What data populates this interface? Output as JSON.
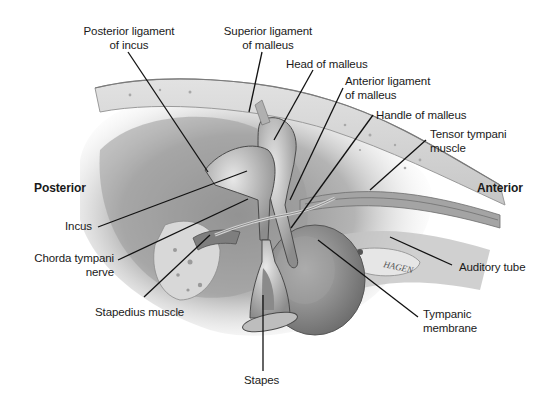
{
  "figure": {
    "orientation": {
      "left": "Posterior",
      "right": "Anterior"
    },
    "signature": "HAGEN",
    "labels": [
      {
        "id": "posterior-ligament-incus",
        "line1": "Posterior ligament",
        "line2": "of incus"
      },
      {
        "id": "superior-ligament-malleus",
        "line1": "Superior ligament",
        "line2": "of malleus"
      },
      {
        "id": "head-of-malleus",
        "line1": "Head of malleus",
        "line2": ""
      },
      {
        "id": "anterior-ligament-malleus",
        "line1": "Anterior ligament",
        "line2": "of malleus"
      },
      {
        "id": "handle-of-malleus",
        "line1": "Handle of malleus",
        "line2": ""
      },
      {
        "id": "tensor-tympani-muscle",
        "line1": "Tensor tympani",
        "line2": "muscle"
      },
      {
        "id": "incus",
        "line1": "Incus",
        "line2": ""
      },
      {
        "id": "chorda-tympani-nerve",
        "line1": "Chorda tympani",
        "line2": "nerve"
      },
      {
        "id": "stapedius-muscle",
        "line1": "Stapedius muscle",
        "line2": ""
      },
      {
        "id": "auditory-tube",
        "line1": "Auditory tube",
        "line2": ""
      },
      {
        "id": "tympanic-membrane",
        "line1": "Tympanic",
        "line2": "membrane"
      },
      {
        "id": "stapes",
        "line1": "Stapes",
        "line2": ""
      }
    ]
  }
}
